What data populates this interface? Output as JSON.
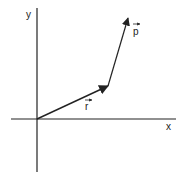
{
  "diagram": {
    "title": "",
    "axes": {
      "x_label": "x",
      "y_label": "y",
      "origin": [
        37,
        119
      ],
      "x_axis": {
        "from": [
          11,
          119
        ],
        "to": [
          176,
          119
        ]
      },
      "y_axis": {
        "from": [
          37,
          8
        ],
        "to": [
          37,
          172
        ]
      }
    },
    "vectors": [
      {
        "name": "r",
        "label": "r",
        "from": [
          37,
          119
        ],
        "to": [
          108,
          86
        ],
        "label_pos": [
          87,
          110
        ],
        "label_arrow": {
          "from": [
            85,
            100
          ],
          "to": [
            92,
            100
          ]
        }
      },
      {
        "name": "p",
        "label": "p",
        "from": [
          108,
          86
        ],
        "to": [
          128,
          18
        ],
        "label_pos": [
          135,
          35
        ],
        "label_arrow": {
          "from": [
            133,
            24
          ],
          "to": [
            140,
            24
          ]
        }
      }
    ],
    "colors": {
      "ink": "#222222",
      "background": "#ffffff"
    }
  }
}
